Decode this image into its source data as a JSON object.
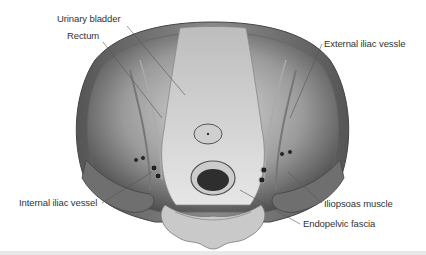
{
  "figure": {
    "type": "anatomical illustration",
    "labels": [
      {
        "id": "urinary-bladder",
        "text": "Urinary bladder",
        "x": 57,
        "y": 19
      },
      {
        "id": "rectum",
        "text": "Rectum",
        "x": 67,
        "y": 36
      },
      {
        "id": "external-iliac-vessle",
        "text": "External iliac vessle",
        "x": 324,
        "y": 38
      },
      {
        "id": "internal-iliac-vessel",
        "text": "Internal iliac vessel",
        "x": 19,
        "y": 196
      },
      {
        "id": "iliopsoas-muscle",
        "text": "Iliopsoas muscle",
        "x": 324,
        "y": 198
      },
      {
        "id": "endopelvic-fascia",
        "text": "Endopelvic fascia",
        "x": 303,
        "y": 218
      }
    ],
    "colors": {
      "background": "#ffffff",
      "label_text": "#333333",
      "leader_line": "#555555",
      "muscle_wall": "#6a6a6a",
      "tissue_light": "#d8d8d8",
      "tissue_dark": "#3a3a3a",
      "bottom_strip": "#e9e9e9"
    }
  }
}
